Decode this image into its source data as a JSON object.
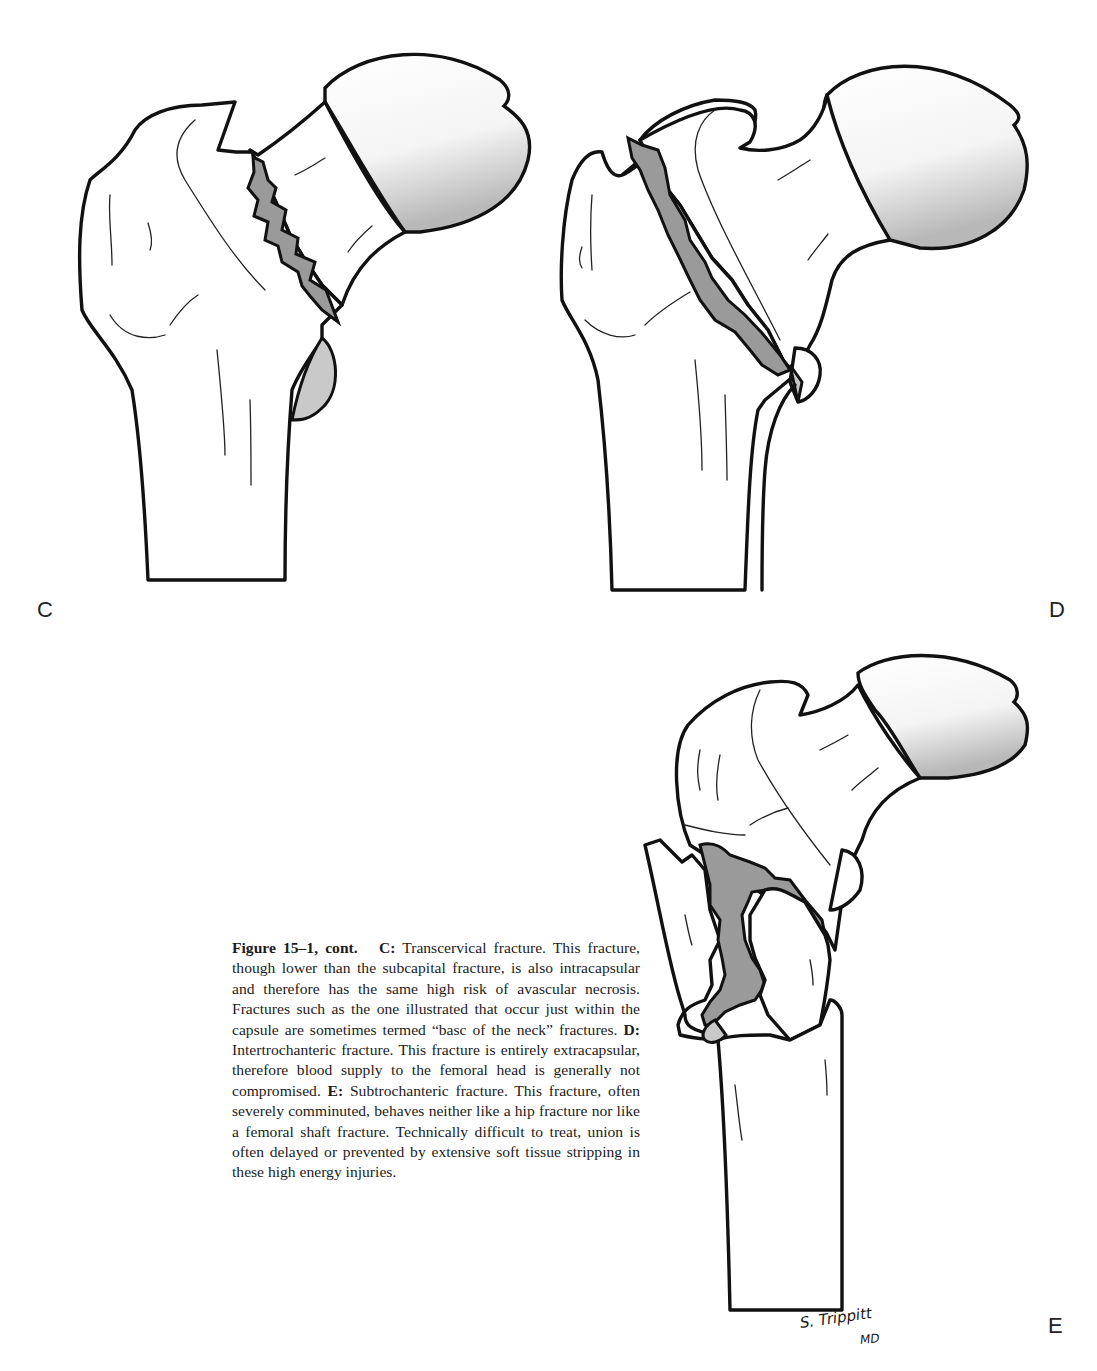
{
  "figure": {
    "number": "Figure 15–1, cont.",
    "panels": [
      {
        "id": "C",
        "label": "C",
        "title": "Transcervical fracture"
      },
      {
        "id": "D",
        "label": "D",
        "title": "Intertrochanteric fracture"
      },
      {
        "id": "E",
        "label": "E",
        "title": "Subtrochanteric fracture"
      }
    ],
    "caption": {
      "lead": "Figure 15–1, cont.",
      "c_label": "C:",
      "c_text": "Transcervical fracture. This fracture, though lower than the subcapital fracture, is also intracapsular and therefore has the same high risk of avascular necrosis. Fractures such as the one illustrated that occur just within the capsule are sometimes termed “basc of the neck” fractures.",
      "d_label": "D:",
      "d_text": "Intertrochanteric fracture. This fracture is entirely extracapsular, therefore blood supply to the femoral head is generally not compromised.",
      "e_label": "E:",
      "e_text": "Subtrochanteric fracture. This fracture, often severely comminuted, behaves neither like a hip fracture nor like a femoral shaft fracture. Technically difficult to treat, union is often delayed or prevented by extensive soft tissue stripping in these high energy injuries."
    },
    "signature": {
      "line1": "S. Trippitt",
      "line2": "MD"
    }
  }
}
